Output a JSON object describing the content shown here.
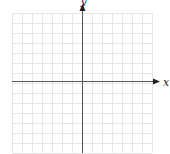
{
  "figure": {
    "type": "cartesian-coordinate-grid",
    "x_axis_label": "x",
    "y_axis_label": "y",
    "grid": {
      "left": 12,
      "top": 13,
      "cell_size": 10,
      "columns": 14,
      "rows": 14,
      "origin_x": 82,
      "origin_y": 81,
      "line_color": "#e6e6e6",
      "axis_color": "#555555"
    },
    "x_axis_arrow": "right",
    "y_axis_arrow": "up"
  }
}
